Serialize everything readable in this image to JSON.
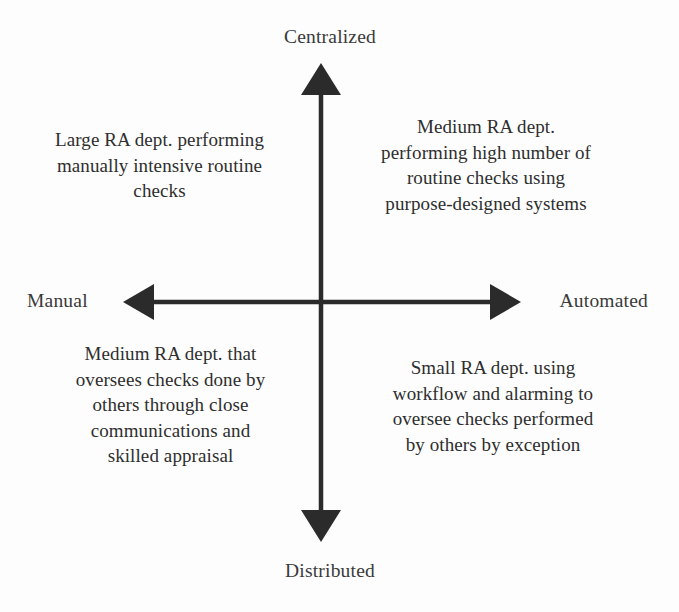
{
  "diagram": {
    "type": "2x2-quadrant-matrix",
    "axis_color": "#2b2b2b",
    "text_color": "#2e2e2e",
    "background": "#fdfdfd",
    "axes": {
      "vertical": {
        "top_label": "Centralized",
        "bottom_label": "Distributed"
      },
      "horizontal": {
        "left_label": "Manual",
        "right_label": "Automated"
      }
    },
    "quadrants": {
      "top_left": {
        "position": "Manual / Centralized",
        "lines": [
          "Large RA dept. performing",
          "manually intensive routine",
          "checks"
        ]
      },
      "top_right": {
        "position": "Automated / Centralized",
        "lines": [
          "Medium RA dept.",
          "performing high number of",
          "routine checks using",
          "purpose-designed systems"
        ]
      },
      "bottom_left": {
        "position": "Manual / Distributed",
        "lines": [
          "Medium RA dept. that",
          "oversees checks done by",
          "others through close",
          "communications and",
          "skilled appraisal"
        ]
      },
      "bottom_right": {
        "position": "Automated / Distributed",
        "lines": [
          "Small RA dept. using",
          "workflow and alarming to",
          "oversee checks performed",
          "by others by exception"
        ]
      }
    }
  }
}
